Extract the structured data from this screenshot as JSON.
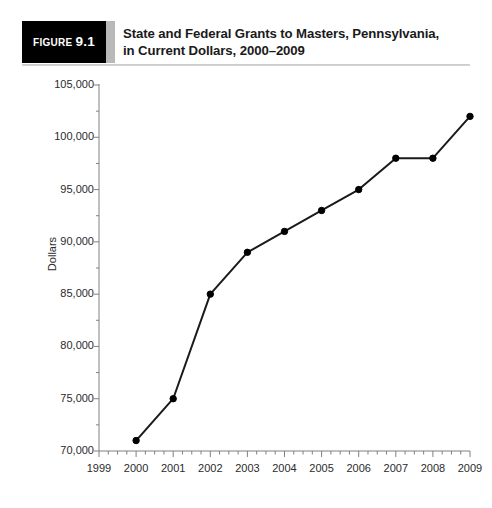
{
  "figure": {
    "badge_prefix": "Figure",
    "badge_number": "9.1",
    "title_line1": "State and Federal Grants to Masters, Pennsylvania,",
    "title_line2": "in Current Dollars, 2000–2009"
  },
  "colors": {
    "badge_background": "#000000",
    "badge_text": "#ffffff",
    "divider": "#b9b9b9",
    "rule": "#c9c9c9",
    "title_text": "#1a1a1a",
    "axis": "#808080",
    "tick_text": "#2b2b2b",
    "series_line": "#1a1a1a",
    "series_marker": "#000000",
    "plot_background": "#ffffff"
  },
  "chart_data": {
    "type": "line",
    "title": "State and Federal Grants to Masters, Pennsylvania, in Current Dollars, 2000–2009",
    "xlabel": "",
    "ylabel": "Dollars",
    "x": [
      2000,
      2001,
      2002,
      2003,
      2004,
      2005,
      2006,
      2007,
      2008,
      2009
    ],
    "values": [
      71000,
      75000,
      85000,
      89000,
      91000,
      93000,
      95000,
      98000,
      98000,
      102000
    ],
    "series": [
      {
        "name": "State and Federal Grants",
        "values": [
          71000,
          75000,
          85000,
          89000,
          91000,
          93000,
          95000,
          98000,
          98000,
          102000
        ]
      }
    ],
    "xlim": [
      1999,
      2009
    ],
    "ylim": [
      70000,
      105000
    ],
    "xticks": [
      1999,
      2000,
      2001,
      2002,
      2003,
      2004,
      2005,
      2006,
      2007,
      2008,
      2009
    ],
    "xtick_labels": [
      "1999",
      "2000",
      "2001",
      "2002",
      "2003",
      "2004",
      "2005",
      "2006",
      "2007",
      "2008",
      "2009"
    ],
    "yticks": [
      70000,
      75000,
      80000,
      85000,
      90000,
      95000,
      100000,
      105000
    ],
    "ytick_labels": [
      "70,000",
      "75,000",
      "80,000",
      "85,000",
      "90,000",
      "95,000",
      "100,000",
      "105,000"
    ],
    "y_minor_ticks": [
      72500,
      77500,
      82500,
      87500,
      92500,
      97500,
      102500
    ],
    "grid": false,
    "legend": false,
    "legend_position": "none",
    "marker": "circle",
    "annotations": []
  }
}
